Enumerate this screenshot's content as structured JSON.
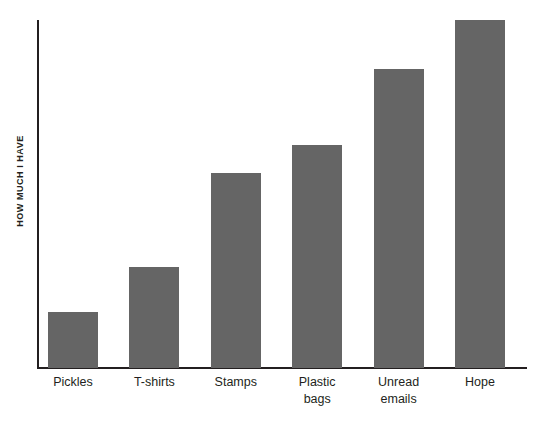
{
  "chart_data": {
    "type": "bar",
    "title": "",
    "subtitle": "",
    "xlabel": "",
    "ylabel": "HOW MUCH I HAVE",
    "categories": [
      "Pickles",
      "T-shirts",
      "Stamps",
      "Plastic bags",
      "Unread emails",
      "Hope"
    ],
    "category_lines": [
      [
        "Pickles"
      ],
      [
        "T-shirts"
      ],
      [
        "Stamps"
      ],
      [
        "Plastic",
        "bags"
      ],
      [
        "Unread",
        "emails"
      ],
      [
        "Hope"
      ]
    ],
    "values": [
      16,
      29,
      56,
      64,
      86,
      100
    ],
    "ylim": [
      0,
      100
    ],
    "ytick_labels": [],
    "grid": false,
    "legend": false,
    "legend_position": "none",
    "bar_color": "#656565",
    "axis_color": "#231f20",
    "background_color": "#ffffff",
    "annotations": []
  },
  "axes": {
    "y_axis_title": "HOW MUCH I HAVE"
  }
}
